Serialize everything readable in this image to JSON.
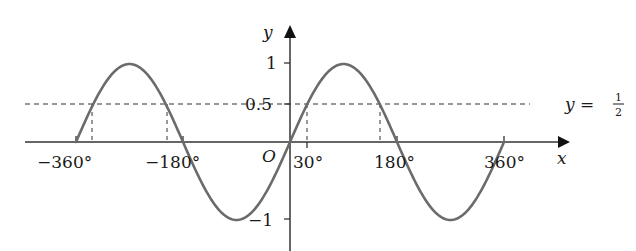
{
  "chart_data": {
    "type": "line",
    "title": "",
    "function": "y = sin x",
    "xlabel": "x",
    "ylabel": "y",
    "origin_label": "O",
    "xlim": [
      -360,
      360
    ],
    "ylim": [
      -1,
      1
    ],
    "grid": false,
    "legend": "none",
    "x_ticks": [
      {
        "value": -360,
        "label": "−360°"
      },
      {
        "value": -180,
        "label": "−180°"
      },
      {
        "value": 30,
        "label": "30°"
      },
      {
        "value": 180,
        "label": "180°"
      },
      {
        "value": 360,
        "label": "360°"
      }
    ],
    "y_ticks": [
      {
        "value": 1,
        "label": "1"
      },
      {
        "value": 0.5,
        "label": "0.5"
      },
      {
        "value": -1,
        "label": "−1"
      }
    ],
    "series": [
      {
        "name": "y = sin x",
        "color": "#6b6b6b",
        "x": [
          -360,
          -330,
          -270,
          -210,
          -180,
          -90,
          0,
          30,
          90,
          150,
          180,
          270,
          360
        ],
        "values": [
          0,
          0.5,
          1,
          0.5,
          0,
          -1,
          0,
          0.5,
          1,
          0.5,
          0,
          -1,
          0
        ]
      }
    ],
    "reference_lines": [
      {
        "type": "horizontal",
        "y": 0.5,
        "style": "dashed",
        "label_lhs": "y =",
        "label_num": "1",
        "label_den": "2"
      }
    ],
    "annotations": [
      {
        "type": "vertical-dashed",
        "x": -330,
        "from": 0,
        "to": 0.5
      },
      {
        "type": "vertical-dashed",
        "x": -210,
        "from": 0,
        "to": 0.5
      },
      {
        "type": "vertical-dashed",
        "x": 30,
        "from": 0,
        "to": 0.5
      },
      {
        "type": "vertical-dashed",
        "x": 150,
        "from": 0,
        "to": 0.5
      }
    ]
  }
}
